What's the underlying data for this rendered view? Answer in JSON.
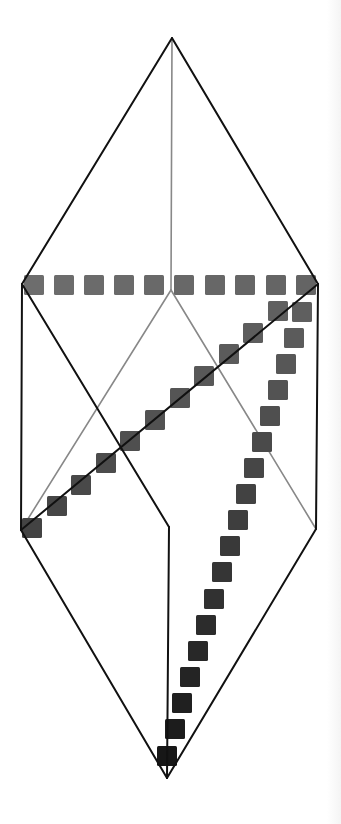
{
  "diagram": {
    "title": "",
    "colors": {
      "background": "#ffffff",
      "outline": "#111111",
      "hidden_edge": "#888888",
      "square_light": "#6e6e6e",
      "square_dark": "#0e0e0e"
    },
    "vertices": {
      "top_apex": [
        172,
        38
      ],
      "left_upper": [
        22,
        284
      ],
      "right_upper": [
        318,
        284
      ],
      "inner_top": [
        171,
        290
      ],
      "left_lower": [
        21,
        530
      ],
      "right_lower": [
        316,
        529
      ],
      "inner_bottom": [
        169,
        527
      ],
      "bottom_apex": [
        167,
        778
      ]
    },
    "edges": {
      "outline": [
        [
          "top_apex",
          "left_upper"
        ],
        [
          "top_apex",
          "right_upper"
        ],
        [
          "left_upper",
          "left_lower"
        ],
        [
          "right_upper",
          "right_lower"
        ],
        [
          "left_lower",
          "bottom_apex"
        ],
        [
          "right_lower",
          "bottom_apex"
        ],
        [
          "left_upper",
          "inner_bottom"
        ],
        [
          "right_upper",
          "left_lower"
        ],
        [
          "inner_bottom",
          "bottom_apex"
        ]
      ],
      "hidden": [
        [
          "top_apex",
          "inner_top"
        ],
        [
          "inner_top",
          "left_lower"
        ],
        [
          "inner_top",
          "right_lower"
        ]
      ]
    },
    "square_size": 20,
    "paths": [
      {
        "name": "horizontal-row",
        "squares": [
          [
            24,
            275
          ],
          [
            54,
            275
          ],
          [
            84,
            275
          ],
          [
            114,
            275
          ],
          [
            144,
            275
          ],
          [
            174,
            275
          ],
          [
            205,
            275
          ],
          [
            235,
            275
          ],
          [
            266,
            275
          ],
          [
            296,
            275
          ]
        ]
      },
      {
        "name": "shallow-diagonal",
        "squares": [
          [
            268,
            301
          ],
          [
            243,
            323
          ],
          [
            219,
            344
          ],
          [
            194,
            366
          ],
          [
            170,
            388
          ],
          [
            145,
            410
          ],
          [
            120,
            431
          ],
          [
            96,
            453
          ],
          [
            71,
            475
          ],
          [
            47,
            496
          ],
          [
            22,
            518
          ]
        ]
      },
      {
        "name": "steep-diagonal",
        "squares": [
          [
            292,
            302
          ],
          [
            284,
            328
          ],
          [
            276,
            354
          ],
          [
            268,
            380
          ],
          [
            260,
            406
          ],
          [
            252,
            432
          ],
          [
            244,
            458
          ],
          [
            236,
            484
          ],
          [
            228,
            510
          ],
          [
            220,
            536
          ],
          [
            212,
            562
          ],
          [
            204,
            589
          ],
          [
            196,
            615
          ],
          [
            188,
            641
          ],
          [
            180,
            667
          ],
          [
            172,
            693
          ],
          [
            165,
            719
          ],
          [
            157,
            746
          ]
        ]
      }
    ]
  }
}
